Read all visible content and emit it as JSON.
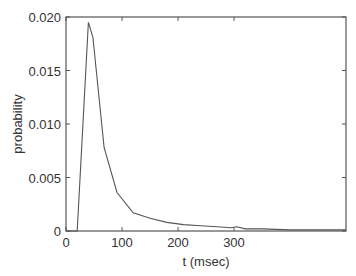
{
  "chart_data": {
    "type": "line",
    "title": "",
    "xlabel": "t (msec)",
    "ylabel": "probability",
    "xlim": [
      0,
      500
    ],
    "ylim": [
      0,
      0.02
    ],
    "xticks": [
      0,
      100,
      200,
      300
    ],
    "xtick_labels": [
      "0",
      "100",
      "200",
      "300"
    ],
    "yticks": [
      0,
      0.005,
      0.01,
      0.015,
      0.02
    ],
    "ytick_labels": [
      "0",
      "0.005",
      "0.010",
      "0.015",
      "0.020"
    ],
    "grid": false,
    "legend": null,
    "series": [
      {
        "name": "probability",
        "color": "#555555",
        "x": [
          0,
          20,
          40,
          48,
          68,
          91,
          120,
          150,
          180,
          210,
          240,
          270,
          295,
          305,
          320,
          350,
          400,
          450,
          500
        ],
        "values": [
          0,
          0,
          0.0195,
          0.0181,
          0.0078,
          0.0036,
          0.0017,
          0.0012,
          0.0008,
          0.0006,
          0.0005,
          0.0004,
          0.0003,
          0.0004,
          0.0002,
          0.0002,
          0.0001,
          0.0001,
          0.0001
        ]
      }
    ]
  }
}
